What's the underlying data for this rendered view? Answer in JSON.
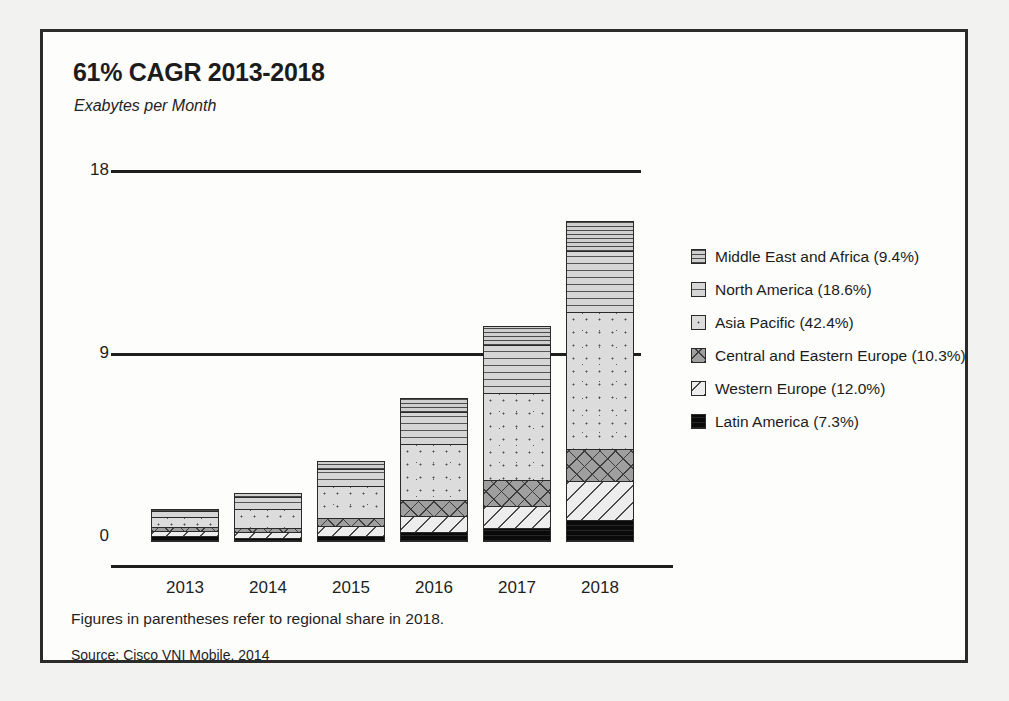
{
  "chart_data": {
    "type": "bar",
    "stacked": true,
    "title": "61% CAGR 2013-2018",
    "subtitle": "Exabytes per Month",
    "xlabel": "",
    "ylabel": "Exabytes per Month",
    "ylim": [
      0,
      18
    ],
    "yticks": [
      0,
      9,
      18
    ],
    "ytick_labels": [
      "0",
      "9",
      "18"
    ],
    "grid": true,
    "legend_position": "right",
    "categories": [
      "2013",
      "2014",
      "2015",
      "2016",
      "2017",
      "2018"
    ],
    "series": [
      {
        "name": "Middle East and Africa",
        "share_2018": "9.4%",
        "pattern": "horizontal-lines",
        "values": [
          0.1,
          0.2,
          0.4,
          0.7,
          0.9,
          1.5
        ]
      },
      {
        "name": "North America",
        "share_2018": "18.6%",
        "pattern": "dashed-rows",
        "values": [
          0.3,
          0.6,
          0.9,
          1.6,
          2.4,
          3.0
        ]
      },
      {
        "name": "Asia Pacific",
        "share_2018": "42.4%",
        "pattern": "dots",
        "values": [
          0.5,
          1.0,
          1.6,
          2.8,
          4.3,
          6.8
        ]
      },
      {
        "name": "Central and Eastern Europe",
        "share_2018": "10.3%",
        "pattern": "crosshatch",
        "values": [
          0.2,
          0.2,
          0.4,
          0.8,
          1.3,
          1.6
        ]
      },
      {
        "name": "Western Europe",
        "share_2018": "12.0%",
        "pattern": "diagonal-lines",
        "values": [
          0.3,
          0.3,
          0.5,
          0.8,
          1.1,
          1.9
        ]
      },
      {
        "name": "Latin America",
        "share_2018": "7.3%",
        "pattern": "solid-black",
        "values": [
          0.2,
          0.1,
          0.2,
          0.4,
          0.6,
          1.0
        ]
      }
    ],
    "totals": [
      1.6,
      2.4,
      4.0,
      7.1,
      10.6,
      15.8
    ],
    "note": "Figures in parentheses refer to regional share in 2018.",
    "source": "Source: Cisco VNI Mobile, 2014"
  },
  "header": {
    "title": "61% CAGR 2013-2018",
    "subtitle": "Exabytes per Month"
  },
  "axis": {
    "y": [
      "18",
      "9",
      "0"
    ],
    "x": [
      "2013",
      "2014",
      "2015",
      "2016",
      "2017",
      "2018"
    ]
  },
  "legend": [
    {
      "label": "Middle East and Africa (9.4%)"
    },
    {
      "label": "North America (18.6%)"
    },
    {
      "label": "Asia Pacific (42.4%)"
    },
    {
      "label": "Central and Eastern Europe (10.3%)"
    },
    {
      "label": "Western Europe (12.0%)"
    },
    {
      "label": "Latin America (7.3%)"
    }
  ],
  "footer": {
    "note": "Figures in parentheses refer to regional share in 2018.",
    "source": "Source: Cisco VNI Mobile, 2014"
  }
}
